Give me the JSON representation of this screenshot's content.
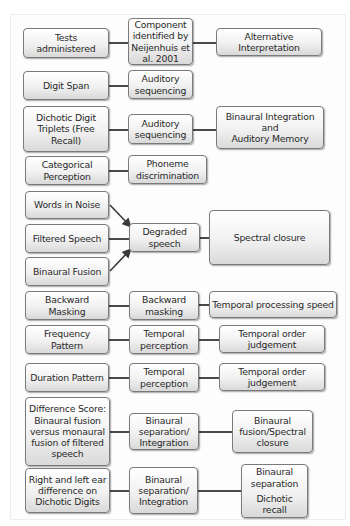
{
  "header": {
    "tests": "Tests administered",
    "component": "Component identified by Neijenhuis et al. 2001",
    "alternative": "Alternative Interpretation"
  },
  "rows": [
    {
      "test": "Digit Span",
      "component": "Auditory sequencing",
      "alternative": ""
    },
    {
      "test": "Dichotic Digit Triplets (Free Recall)",
      "component": "Auditory sequencing",
      "alternative": "Binaural Integration and Auditory Memory"
    },
    {
      "test": "Categorical Perception",
      "component": "Phoneme discrimination",
      "alternative": ""
    },
    {
      "test": "Words in Noise",
      "component": "Degraded speech",
      "alternative": "Spectral closure"
    },
    {
      "test": "Filtered Speech",
      "component": "Degraded speech",
      "alternative": "Spectral closure"
    },
    {
      "test": "Binaural Fusion",
      "component": "Degraded speech",
      "alternative": "Spectral closure"
    },
    {
      "test": "Backward Masking",
      "component": "Backward masking",
      "alternative": "Temporal processing speed"
    },
    {
      "test": "Frequency Pattern",
      "component": "Temporal perception",
      "alternative": "Temporal order judgement"
    },
    {
      "test": "Duration Pattern",
      "component": "Temporal perception",
      "alternative": "Temporal order judgement"
    },
    {
      "test": "Difference Score: Binaural fusion versus monaural fusion of filtered speech",
      "component": "Binaural separation/ Integration",
      "alternative": "Binaural fusion/Spectral closure"
    },
    {
      "test": "Right and left ear difference on Dichotic Digits",
      "component": "Binaural separation/ Integration",
      "alternative": "Binaural separation Dichotic recall"
    }
  ],
  "boxes": {
    "h_tests": [
      "Tests",
      "administered"
    ],
    "h_component": [
      "Component",
      "identified by",
      "Neijenhuis et",
      "al. 2001"
    ],
    "h_alt": [
      "Alternative",
      "Interpretation"
    ],
    "digit_span": [
      "Digit Span"
    ],
    "aud_seq_1": [
      "Auditory",
      "sequencing"
    ],
    "dichotic": [
      "Dichotic Digit",
      "Triplets (Free",
      "Recall)"
    ],
    "aud_seq_2": [
      "Auditory",
      "sequencing"
    ],
    "binaural_int": [
      "Binaural Integration",
      "and",
      "Auditory Memory"
    ],
    "categorical": [
      "Categorical",
      "Perception"
    ],
    "phoneme": [
      "Phoneme",
      "discrimination"
    ],
    "words_noise": [
      "Words in Noise"
    ],
    "filtered": [
      "Filtered Speech"
    ],
    "binaural_fusion": [
      "Binaural Fusion"
    ],
    "degraded": [
      "Degraded",
      "speech"
    ],
    "spectral": [
      "Spectral closure"
    ],
    "backward_test": [
      "Backward",
      "Masking"
    ],
    "backward_comp": [
      "Backward",
      "masking"
    ],
    "temporal_speed": [
      "Temporal processing speed"
    ],
    "freq_pattern": [
      "Frequency Pattern"
    ],
    "temp_perc_1": [
      "Temporal",
      "perception"
    ],
    "temp_order_1": [
      "Temporal order",
      "judgement"
    ],
    "duration": [
      "Duration Pattern"
    ],
    "temp_perc_2": [
      "Temporal",
      "perception"
    ],
    "temp_order_2": [
      "Temporal order",
      "judgement"
    ],
    "diff_score": [
      "Difference Score:",
      "Binaural fusion",
      "versus monaural",
      "fusion of filtered",
      "speech"
    ],
    "bin_sep_1": [
      "Binaural",
      "separation/",
      "Integration"
    ],
    "bin_fusion_spec": [
      "Binaural",
      "fusion/Spectral",
      "closure"
    ],
    "ear_diff": [
      "Right and left ear",
      "difference on",
      "Dichotic Digits"
    ],
    "bin_sep_2": [
      "Binaural",
      "separation/",
      "Integration"
    ],
    "bin_sep_dichotic": [
      "Binaural",
      "separation",
      "Dichotic",
      "recall"
    ]
  },
  "colors": {
    "box_border": "#7a7a7a",
    "box_fill_top": "#ffffff",
    "box_fill_bottom": "#d9d9d9",
    "connector": "#4a4a4a",
    "text": "#2a2a2a"
  }
}
